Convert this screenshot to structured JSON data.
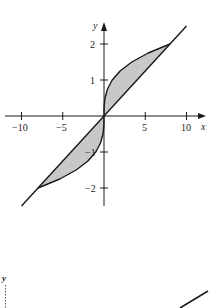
{
  "figure": {
    "top_plot": {
      "x_axis_label": "x",
      "y_axis_label": "y",
      "x_ticks": [
        {
          "value": -10,
          "label": "−10"
        },
        {
          "value": -5,
          "label": "−5"
        },
        {
          "value": 5,
          "label": "5"
        },
        {
          "value": 10,
          "label": "10"
        }
      ],
      "y_ticks": [
        {
          "value": 2,
          "label": "2"
        },
        {
          "value": 1,
          "label": "1"
        },
        {
          "value": -1,
          "label": "−1"
        },
        {
          "value": -2,
          "label": "−2"
        }
      ],
      "curves": [
        {
          "name": "cube-root-curve",
          "equation": "x = y^3"
        },
        {
          "name": "line",
          "equation": "y = x/4"
        }
      ],
      "intersections": [
        [
          -8,
          -2
        ],
        [
          0,
          0
        ],
        [
          8,
          2
        ]
      ],
      "shade_color": "#c8c8c8",
      "line_color": "#1a1a1a"
    },
    "bottom_plot_fragment": {
      "y_axis_label": "y"
    }
  }
}
